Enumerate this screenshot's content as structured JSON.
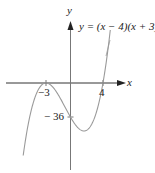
{
  "graph": {
    "equation": "y = (x − 4)(x + 3)²",
    "equation_parts": {
      "lhs": "y = (x − 4)(x + 3)",
      "exp": "2"
    },
    "x_axis_label": "x",
    "y_axis_label": "y",
    "x_tick_labels": [
      "−3",
      "4"
    ],
    "y_tick_labels": [
      "− 36"
    ],
    "curve_color": "#9a9a9a",
    "axis_color": "#333333"
  }
}
